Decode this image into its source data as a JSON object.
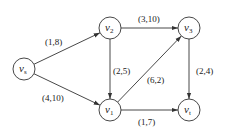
{
  "diagram": {
    "type": "directed network (flow network)",
    "nodes": [
      {
        "id": "vs",
        "label": "v",
        "sub": "s",
        "x": 24,
        "y": 69
      },
      {
        "id": "v2",
        "label": "v",
        "sub": "2",
        "x": 110,
        "y": 28
      },
      {
        "id": "v3",
        "label": "v",
        "sub": "3",
        "x": 189,
        "y": 28
      },
      {
        "id": "v1",
        "label": "v",
        "sub": "1",
        "x": 110,
        "y": 110
      },
      {
        "id": "vt",
        "label": "v",
        "sub": "t",
        "x": 189,
        "y": 110
      }
    ],
    "edges": [
      {
        "from": "vs",
        "to": "v2",
        "label": "(1,8)",
        "lx": 45,
        "ly": 45
      },
      {
        "from": "vs",
        "to": "v1",
        "label": "(4,10)",
        "lx": 42,
        "ly": 101
      },
      {
        "from": "v2",
        "to": "v3",
        "label": "(3,10)",
        "lx": 138,
        "ly": 22
      },
      {
        "from": "v2",
        "to": "v1",
        "label": "(2,5)",
        "lx": 113,
        "ly": 74
      },
      {
        "from": "v1",
        "to": "v3",
        "label": "(6,2)",
        "lx": 147,
        "ly": 83
      },
      {
        "from": "v3",
        "to": "vt",
        "label": "(2,4)",
        "lx": 196,
        "ly": 74
      },
      {
        "from": "v1",
        "to": "vt",
        "label": "(1,7)",
        "lx": 138,
        "ly": 125
      }
    ]
  }
}
